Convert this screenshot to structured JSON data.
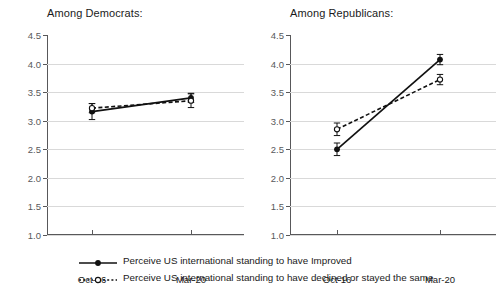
{
  "chart_data": [
    {
      "type": "line",
      "title": "Among Democrats:",
      "xlabel": "",
      "ylabel": "",
      "categories": [
        "Oct-16",
        "Mar-20"
      ],
      "ylim": [
        1.0,
        4.5
      ],
      "yticks": [
        "1.0",
        "1.5",
        "2.0",
        "2.5",
        "3.0",
        "3.5",
        "4.0",
        "4.5"
      ],
      "grid": true,
      "legend_position": "bottom",
      "series": [
        {
          "name": "Perceive US international standing to have Improved",
          "marker": "filled-circle",
          "line": "solid",
          "values": [
            3.16,
            3.4
          ],
          "errors": [
            0.14,
            0.08
          ]
        },
        {
          "name": "Perceive US international standing to have declined or stayed the same",
          "marker": "open-circle",
          "line": "dashed",
          "values": [
            3.22,
            3.35
          ],
          "errors": [
            0.08,
            0.12
          ]
        }
      ]
    },
    {
      "type": "line",
      "title": "Among Republicans:",
      "xlabel": "",
      "ylabel": "",
      "categories": [
        "Oct-16",
        "Mar-20"
      ],
      "ylim": [
        1.0,
        4.5
      ],
      "yticks": [
        "1.0",
        "1.5",
        "2.0",
        "2.5",
        "3.0",
        "3.5",
        "4.0",
        "4.5"
      ],
      "grid": true,
      "legend_position": "bottom",
      "series": [
        {
          "name": "Perceive US international standing to have Improved",
          "marker": "filled-circle",
          "line": "solid",
          "values": [
            2.5,
            4.07
          ],
          "errors": [
            0.11,
            0.09
          ]
        },
        {
          "name": "Perceive US international standing to have declined or stayed the same",
          "marker": "open-circle",
          "line": "dashed",
          "values": [
            2.85,
            3.72
          ],
          "errors": [
            0.11,
            0.09
          ]
        }
      ]
    }
  ],
  "charts": {
    "left": {
      "title": "Among Democrats:",
      "yticks": [
        "4.5",
        "4.0",
        "3.5",
        "3.0",
        "2.5",
        "2.0",
        "1.5",
        "1.0"
      ],
      "xticks": [
        "Oct-16",
        "Mar-20"
      ]
    },
    "right": {
      "title": "Among Republicans:",
      "yticks": [
        "4.5",
        "4.0",
        "3.5",
        "3.0",
        "2.5",
        "2.0",
        "1.5",
        "1.0"
      ],
      "xticks": [
        "Oct-16",
        "Mar-20"
      ]
    }
  },
  "legend": {
    "items": [
      {
        "label": "Perceive US international standing to have Improved"
      },
      {
        "label": "Perceive US international standing to have declined or stayed the same"
      }
    ]
  },
  "colors": {
    "series": "#111111",
    "axis": "#58585a",
    "grid": "#d9d9d9",
    "background": "#ffffff"
  }
}
